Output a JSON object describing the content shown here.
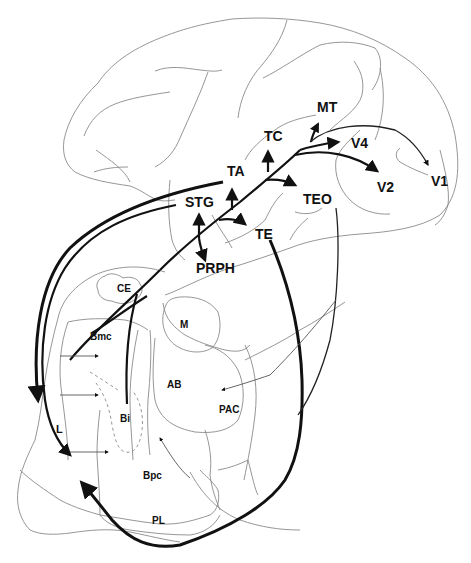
{
  "diagram": {
    "type": "anatomical pathway diagram (lateral view of macaque brain with amygdala nuclei)",
    "cortical_areas": {
      "MT": "MT",
      "TC": "TC",
      "V4": "V4",
      "V1": "V1",
      "V2": "V2",
      "TA": "TA",
      "TEO": "TEO",
      "STG": "STG",
      "TE": "TE",
      "PRPH": "PRPH"
    },
    "amygdala_nuclei": {
      "CE": "CE",
      "M": "M",
      "Bmc": "Bmc",
      "AB": "AB",
      "Bi": "Bi",
      "PAC": "PAC",
      "L": "L",
      "Bpc": "Bpc",
      "PL": "PL"
    },
    "connections": [
      {
        "from": "V1",
        "to": "V2/V4 stream",
        "weight": "thin"
      },
      {
        "from": "stream",
        "to": "MT",
        "weight": "medium"
      },
      {
        "from": "stream",
        "to": "V4",
        "weight": "medium"
      },
      {
        "from": "stream",
        "to": "V2",
        "weight": "medium"
      },
      {
        "from": "stream",
        "to": "TC",
        "weight": "medium"
      },
      {
        "from": "stream",
        "to": "TEO",
        "weight": "medium"
      },
      {
        "from": "stream",
        "to": "TA",
        "weight": "medium"
      },
      {
        "from": "stream",
        "to": "TE",
        "weight": "medium"
      },
      {
        "from": "stream",
        "to": "STG",
        "weight": "medium"
      },
      {
        "from": "stream",
        "to": "PRPH",
        "weight": "medium"
      },
      {
        "from": "TA",
        "to": "L",
        "weight": "thick"
      },
      {
        "from": "STG",
        "to": "L",
        "weight": "medium"
      },
      {
        "from": "TE",
        "to": "L",
        "weight": "thick"
      },
      {
        "from": "TEO",
        "to": "AB",
        "weight": "thin"
      },
      {
        "from": "stream",
        "to": "Bmc",
        "weight": "medium"
      },
      {
        "from": "stream",
        "to": "Bi",
        "weight": "medium"
      },
      {
        "from": "L",
        "to": "Bpc",
        "weight": "thin"
      },
      {
        "from": "L",
        "to": "Bi/Bmc",
        "weight": "thin"
      }
    ]
  }
}
